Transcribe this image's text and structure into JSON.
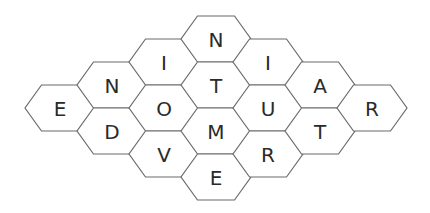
{
  "puzzle": {
    "type": "hexagon-letter-grid",
    "stroke_color": "#6b6b6b",
    "letter_color": "#2a2a2a",
    "background": "#ffffff",
    "cells": [
      {
        "id": "c0-0",
        "col": 0,
        "row": 0,
        "letter": "E",
        "cx": 60,
        "cy": 108
      },
      {
        "id": "c1-0",
        "col": 1,
        "row": 0,
        "letter": "N",
        "cx": 112,
        "cy": 85
      },
      {
        "id": "c1-1",
        "col": 1,
        "row": 1,
        "letter": "D",
        "cx": 112,
        "cy": 131
      },
      {
        "id": "c2-0",
        "col": 2,
        "row": 0,
        "letter": "I",
        "cx": 164,
        "cy": 62
      },
      {
        "id": "c2-1",
        "col": 2,
        "row": 1,
        "letter": "O",
        "cx": 164,
        "cy": 108
      },
      {
        "id": "c2-2",
        "col": 2,
        "row": 2,
        "letter": "V",
        "cx": 164,
        "cy": 154
      },
      {
        "id": "c3-0",
        "col": 3,
        "row": 0,
        "letter": "N",
        "cx": 216,
        "cy": 39
      },
      {
        "id": "c3-1",
        "col": 3,
        "row": 1,
        "letter": "T",
        "cx": 216,
        "cy": 85
      },
      {
        "id": "c3-2",
        "col": 3,
        "row": 2,
        "letter": "M",
        "cx": 216,
        "cy": 131
      },
      {
        "id": "c3-3",
        "col": 3,
        "row": 3,
        "letter": "E",
        "cx": 216,
        "cy": 177
      },
      {
        "id": "c4-0",
        "col": 4,
        "row": 0,
        "letter": "I",
        "cx": 268,
        "cy": 62
      },
      {
        "id": "c4-1",
        "col": 4,
        "row": 1,
        "letter": "U",
        "cx": 268,
        "cy": 108
      },
      {
        "id": "c4-2",
        "col": 4,
        "row": 2,
        "letter": "R",
        "cx": 268,
        "cy": 154
      },
      {
        "id": "c5-0",
        "col": 5,
        "row": 0,
        "letter": "A",
        "cx": 320,
        "cy": 85
      },
      {
        "id": "c5-1",
        "col": 5,
        "row": 1,
        "letter": "T",
        "cx": 320,
        "cy": 131
      },
      {
        "id": "c6-0",
        "col": 6,
        "row": 0,
        "letter": "R",
        "cx": 372,
        "cy": 108
      }
    ]
  }
}
